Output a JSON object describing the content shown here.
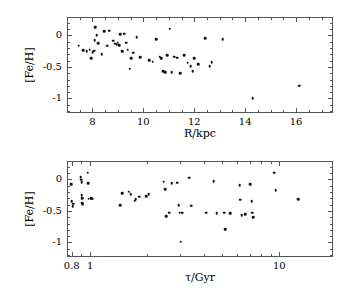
{
  "figure": {
    "background": "#ffffff",
    "marker_color": "#111111",
    "axis_color": "#555555"
  },
  "chart_data": [
    {
      "type": "scatter",
      "panel": "top",
      "title": "",
      "xlabel": "R/kpc",
      "ylabel": "[Fe/H]",
      "xscale": "linear",
      "yscale": "linear",
      "xlim": [
        7.0,
        17.45
      ],
      "ylim": [
        -1.23,
        0.29
      ],
      "xticks": [
        8,
        10,
        12,
        14,
        16
      ],
      "xticklabels": [
        "8",
        "10",
        "12",
        "14",
        "16"
      ],
      "yticks": [
        0,
        -0.5,
        -1
      ],
      "yticklabels": [
        "0",
        "-0.5",
        "-1"
      ],
      "minor_ticks": true,
      "grid": false,
      "legend": null,
      "x": [
        7.42,
        7.6,
        7.74,
        7.86,
        7.92,
        7.97,
        8.02,
        8.05,
        8.08,
        8.12,
        8.18,
        8.32,
        8.42,
        8.55,
        8.62,
        8.78,
        8.86,
        8.92,
        8.96,
        9.0,
        9.05,
        9.12,
        9.2,
        9.28,
        9.34,
        9.42,
        9.48,
        9.56,
        9.7,
        9.84,
        10.2,
        10.32,
        10.46,
        10.6,
        10.66,
        10.74,
        10.82,
        10.9,
        11.0,
        11.08,
        11.18,
        11.28,
        11.4,
        11.56,
        11.7,
        11.82,
        11.9,
        11.96,
        12.12,
        12.4,
        12.56,
        12.64,
        13.08,
        14.26,
        16.08
      ],
      "y": [
        -0.15,
        -0.22,
        -0.24,
        -0.21,
        -0.35,
        -0.25,
        -0.23,
        -0.06,
        0.14,
        0.02,
        -0.11,
        -0.28,
        0.08,
        -0.15,
        0.09,
        -0.07,
        -0.12,
        -0.13,
        -0.1,
        -0.14,
        0.03,
        -0.24,
        0.04,
        -0.1,
        -0.21,
        -0.51,
        -0.35,
        -0.26,
        -0.01,
        -0.33,
        -0.38,
        -0.4,
        -0.05,
        -0.32,
        -0.35,
        -0.55,
        -0.57,
        -0.3,
        0.12,
        -0.57,
        -0.32,
        -0.34,
        -0.58,
        -0.3,
        -0.42,
        -0.47,
        -0.55,
        -0.35,
        -0.44,
        -0.03,
        -0.47,
        -0.41,
        -0.05,
        -0.98,
        -0.78
      ]
    },
    {
      "type": "scatter",
      "panel": "bottom",
      "title": "",
      "xlabel": "τ/Gyr",
      "ylabel": "[Fe/H]",
      "xscale": "log",
      "yscale": "linear",
      "xlim": [
        0.755,
        19.2
      ],
      "ylim": [
        -1.23,
        0.29
      ],
      "xticks": [
        0.8,
        1,
        10
      ],
      "xticklabels": [
        "0.8",
        "1",
        "10"
      ],
      "yticks": [
        0,
        -0.5,
        -1
      ],
      "yticklabels": [
        "0",
        "-0.5",
        "-1"
      ],
      "minor_ticks": true,
      "grid": false,
      "legend": null,
      "x": [
        0.785,
        0.79,
        0.8,
        0.805,
        0.88,
        0.885,
        0.89,
        0.89,
        0.895,
        0.9,
        0.905,
        0.96,
        0.965,
        0.97,
        1.0,
        1.01,
        1.42,
        1.46,
        1.58,
        1.62,
        1.7,
        1.72,
        1.8,
        1.96,
        2.02,
        2.42,
        2.46,
        2.5,
        2.58,
        2.66,
        2.86,
        2.9,
        2.94,
        2.98,
        3.02,
        3.3,
        3.38,
        4.05,
        4.45,
        4.6,
        5.05,
        5.12,
        5.45,
        6.1,
        6.15,
        6.25,
        6.5,
        6.95,
        7.05,
        7.1,
        7.2,
        9.3,
        9.45,
        12.4
      ],
      "y": [
        -0.06,
        -0.33,
        -0.41,
        -0.37,
        0.05,
        0.01,
        -0.03,
        -0.24,
        -0.28,
        -0.36,
        -0.38,
        0.12,
        -0.05,
        -0.29,
        -0.28,
        -0.29,
        -0.39,
        -0.2,
        -0.18,
        -0.22,
        -0.32,
        -0.3,
        -0.26,
        -0.25,
        -0.22,
        -0.02,
        -0.14,
        -0.57,
        -0.51,
        -0.05,
        -0.04,
        -0.39,
        -0.51,
        -0.97,
        -0.51,
        0.04,
        -0.4,
        -0.51,
        -0.01,
        -0.52,
        -0.51,
        -0.77,
        -0.52,
        -0.08,
        -0.31,
        -0.55,
        -0.54,
        -0.06,
        -0.33,
        -0.51,
        -0.58,
        0.12,
        -0.16,
        -0.3
      ]
    }
  ]
}
